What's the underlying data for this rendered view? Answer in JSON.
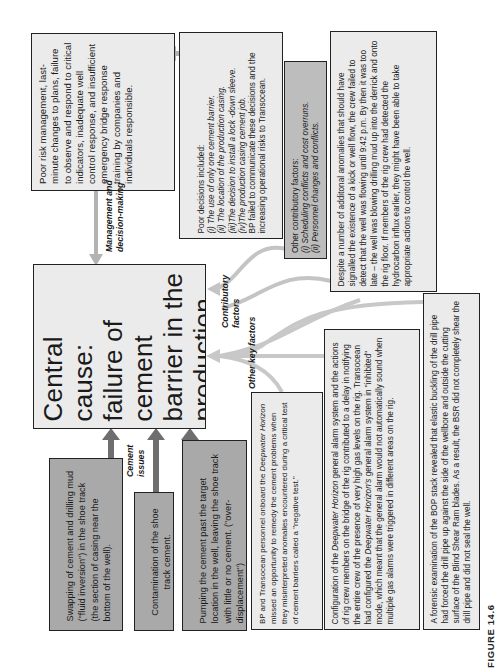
{
  "figure_label": "FIGURE 14.6",
  "central": {
    "text": "Central cause: failure of cement barrier in the production casing string"
  },
  "labels": {
    "management": "Management and decision-making",
    "contributory": "Contributory factors",
    "other_key": "Other key factors",
    "cement_issues": "Cement issues"
  },
  "boxes": {
    "management_summary": "Poor risk management, last-minute changes to plans, failure to observe and respond to critical indicators, inadequate well control response, and insufficient emergency bridge response training by companies and individuals responsible.",
    "poor_decisions": {
      "heading": "Poor decisions included:",
      "items": [
        "(i)  The use of only one cement barrier.",
        "(ii)  The location of the production casing.",
        "(iii)The decision to install a lock -down sleeve.",
        "(iv)The production casing cement job."
      ],
      "footer": "BP failed to communicate these decisions and the increasing operational risks to Transocean."
    },
    "other_contributory": {
      "heading": "Other contributory factors:",
      "items": [
        "(i)  Scheduling conflicts and cost overruns.",
        "(ii)  Personnel changes and conflicts."
      ]
    },
    "anomalies": "Despite a number of additonal anomalies that should have signalled the existence of a kick or well flow, the crew failed to detect that the well was flowing until 9:42 p.m. By then it was too late – the well was blowing drilling mud up into the derrick and onto the rig floor. If members of the rig crew had detected the hydrocarbon influx earlier, they might have been able to take appropriate actions to control the well.",
    "swapping": "Swapping of cement and drilling mud (\"fluid inversion\") in the shoe track (the section of casing near the bottom of the well).",
    "contamination": "Contamination of the shoe track cement.",
    "pumping": "Pumping the cement past the target location in the well, leaving the shoe track with little or no cement. (\"over-displacement\")",
    "negative_test": {
      "pre": "BP and Transocean personnel onboard the ",
      "italic": "Deepwater Horizon",
      "post": " missed an opportunity to remedy the cement problems when they misinterpreted anomalies encountered during a critical test of cement barriers called a \"negative test.\""
    },
    "alarm": {
      "p1": "Configuration of the ",
      "i1": "Deepwater Horizon",
      "p2": " general alarm system and the actions of rig crew members on the bridge of the rig contributed to a delay in notifying the entire crew of the presence of very high gas levels on the rig. Transocean had configured the ",
      "i2": "Deepwater Horizon's",
      "p3": " general alarm system in \"inhibited\" mode, which meant that the general alarm would not automatically sound when multiple gas alarms were triggered in different areas on the rig."
    },
    "bop": "A forensic examination of the BOP stack revealed that elastic buckling of the drill pipe had forced the drill pipe up against the side of the wellbore and outside the cutting surface of the Blind Shear Ram blades. As a result, the BSR did not completely shear the drill pipe and did not seal the well."
  },
  "colors": {
    "light_box": "#ebebeb",
    "mid_box": "#bdbdbd",
    "dark_box": "#a9a9a9",
    "arrow_light": "#b8b8b8",
    "arrow_dark": "#6e6e6e",
    "border": "#222222"
  }
}
